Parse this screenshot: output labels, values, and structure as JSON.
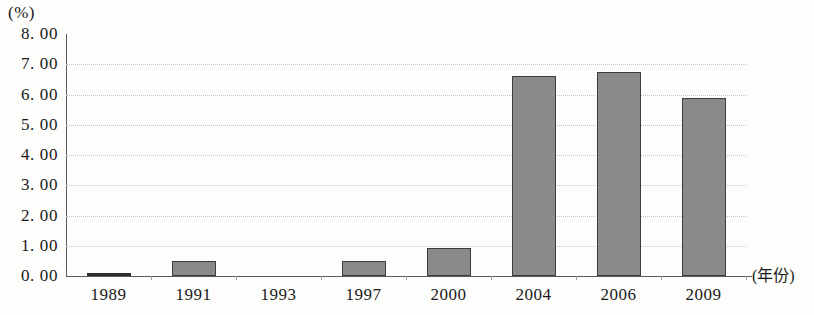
{
  "chart_data": {
    "type": "bar",
    "title": "",
    "subtitle": "",
    "unit_label": "(%)",
    "xlabel": "(年份)",
    "ylabel": "",
    "categories": [
      "1989",
      "1991",
      "1993",
      "1997",
      "2000",
      "2004",
      "2006",
      "2009"
    ],
    "values": [
      0.08,
      0.5,
      0.0,
      0.5,
      0.93,
      6.62,
      6.75,
      5.88
    ],
    "ylim": [
      0,
      8
    ],
    "ytick_labels": [
      "8. 00",
      "7. 00",
      "6. 00",
      "5. 00",
      "4. 00",
      "3. 00",
      "2. 00",
      "1. 00",
      "0. 00"
    ],
    "ytick_values": [
      8,
      7,
      6,
      5,
      4,
      3,
      2,
      1,
      0
    ],
    "grid": true,
    "grid_style": "dotted",
    "legend": "none",
    "bar_color": "#8a8a8a",
    "bar_border_color": "#3d3d3d",
    "axis_color": "#5b5b5b",
    "grid_color": "#c3c3bd",
    "background_color": "#fdfdfb"
  }
}
